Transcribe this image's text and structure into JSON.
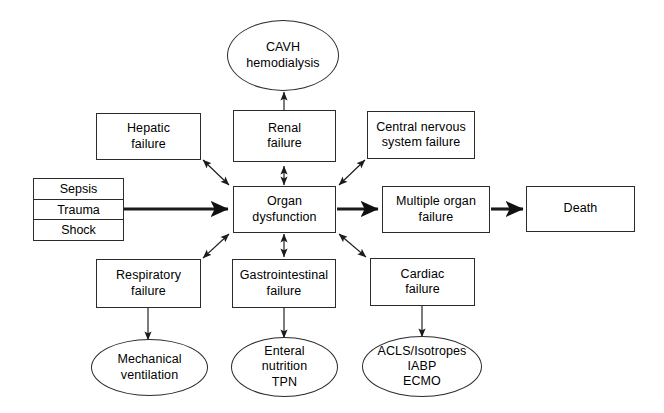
{
  "diagram": {
    "type": "flowchart",
    "stroke_color": "#2b2b2b",
    "background_color": "#ffffff",
    "inputs": {
      "name": "precipitating-factors-stack",
      "items": [
        {
          "label": "Sepsis"
        },
        {
          "label": "Trauma"
        },
        {
          "label": "Shock"
        }
      ]
    },
    "nodes": [
      {
        "id": "organ-dysfunction",
        "label": "Organ\ndysfunction",
        "shape": "box"
      },
      {
        "id": "hepatic-failure",
        "label": "Hepatic\nfailure",
        "shape": "box"
      },
      {
        "id": "renal-failure",
        "label": "Renal\nfailure",
        "shape": "box"
      },
      {
        "id": "cns-failure",
        "label": "Central nervous\nsystem failure",
        "shape": "box"
      },
      {
        "id": "respiratory-failure",
        "label": "Respiratory\nfailure",
        "shape": "box"
      },
      {
        "id": "gastrointestinal-failure",
        "label": "Gastrointestinal\nfailure",
        "shape": "box"
      },
      {
        "id": "cardiac-failure",
        "label": "Cardiac\nfailure",
        "shape": "box"
      },
      {
        "id": "multiple-organ-failure",
        "label": "Multiple organ\nfailure",
        "shape": "box"
      },
      {
        "id": "death",
        "label": "Death",
        "shape": "box"
      },
      {
        "id": "cavh-hemodialysis",
        "label": "CAVH\nhemodialysis",
        "shape": "ellipse"
      },
      {
        "id": "mechanical-ventilation",
        "label": "Mechanical\nventilation",
        "shape": "ellipse"
      },
      {
        "id": "enteral-nutrition",
        "label": "Enteral\nnutrition\nTPN",
        "shape": "ellipse"
      },
      {
        "id": "acls-iabp-ecmo",
        "label": "ACLS/Isotropes\nIABP\nECMO",
        "shape": "ellipse"
      }
    ],
    "edges": [
      {
        "from": "precipitating-factors-stack",
        "to": "organ-dysfunction",
        "style": "thick-single"
      },
      {
        "from": "organ-dysfunction",
        "to": "hepatic-failure",
        "style": "double"
      },
      {
        "from": "organ-dysfunction",
        "to": "renal-failure",
        "style": "double"
      },
      {
        "from": "organ-dysfunction",
        "to": "cns-failure",
        "style": "double"
      },
      {
        "from": "organ-dysfunction",
        "to": "respiratory-failure",
        "style": "double"
      },
      {
        "from": "organ-dysfunction",
        "to": "gastrointestinal-failure",
        "style": "double"
      },
      {
        "from": "organ-dysfunction",
        "to": "cardiac-failure",
        "style": "double"
      },
      {
        "from": "organ-dysfunction",
        "to": "multiple-organ-failure",
        "style": "thick-single"
      },
      {
        "from": "multiple-organ-failure",
        "to": "death",
        "style": "thick-single"
      },
      {
        "from": "renal-failure",
        "to": "cavh-hemodialysis",
        "style": "single"
      },
      {
        "from": "respiratory-failure",
        "to": "mechanical-ventilation",
        "style": "single"
      },
      {
        "from": "gastrointestinal-failure",
        "to": "enteral-nutrition",
        "style": "single"
      },
      {
        "from": "cardiac-failure",
        "to": "acls-iabp-ecmo",
        "style": "single"
      }
    ]
  }
}
